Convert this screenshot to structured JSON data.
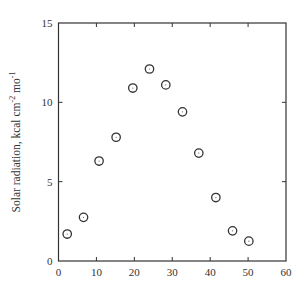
{
  "chart_data": {
    "type": "scatter",
    "title": "",
    "xlabel": "",
    "ylabel": "Solar radiation, kcal cm^-2 mo^-1",
    "ylabel_parts": {
      "main": "Solar radiation, kcal cm",
      "sup1": "-2",
      "mid": " mo",
      "sup2": "-1"
    },
    "xlim": [
      0,
      60
    ],
    "ylim": [
      0,
      15
    ],
    "xticks": [
      0,
      10,
      20,
      30,
      40,
      50,
      60
    ],
    "yticks": [
      0,
      5,
      10,
      15
    ],
    "grid": false,
    "legend": null,
    "marker": "open-circle",
    "x": [
      2.3,
      6.6,
      10.7,
      15.2,
      19.6,
      24.0,
      28.3,
      32.7,
      37.0,
      41.5,
      45.9,
      50.2
    ],
    "y": [
      1.7,
      2.75,
      6.3,
      7.8,
      10.9,
      12.1,
      11.1,
      9.4,
      6.8,
      4.0,
      1.9,
      1.25
    ]
  }
}
